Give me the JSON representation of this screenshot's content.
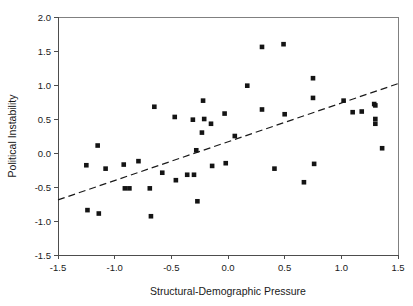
{
  "chart_data": {
    "type": "scatter",
    "title": "",
    "xlabel": "Structural-Demographic Pressure",
    "ylabel": "Political Instability",
    "xlim": [
      -1.5,
      1.5
    ],
    "ylim": [
      -1.5,
      2.0
    ],
    "xticks": [
      "-1.5",
      "-1.0",
      "-0.5",
      "0.0",
      "0.5",
      "1.0",
      "1.5"
    ],
    "xtick_values": [
      -1.5,
      -1.0,
      -0.5,
      0.0,
      0.5,
      1.0,
      1.5
    ],
    "yticks": [
      "-1.5",
      "-1.0",
      "-0.5",
      "0.0",
      "0.5",
      "1.0",
      "1.5",
      "2.0"
    ],
    "ytick_values": [
      -1.5,
      -1.0,
      -0.5,
      0.0,
      0.5,
      1.0,
      1.5,
      2.0
    ],
    "grid": false,
    "legend": false,
    "marker": "square",
    "marker_color": "#141414",
    "series": [
      {
        "name": "observations",
        "points": [
          [
            -1.25,
            -0.18
          ],
          [
            -1.24,
            -0.84
          ],
          [
            -1.15,
            0.11
          ],
          [
            -1.14,
            -0.89
          ],
          [
            -1.08,
            -0.23
          ],
          [
            -0.92,
            -0.17
          ],
          [
            -0.91,
            -0.52
          ],
          [
            -0.87,
            -0.52
          ],
          [
            -0.79,
            -0.12
          ],
          [
            -0.69,
            -0.52
          ],
          [
            -0.68,
            -0.93
          ],
          [
            -0.65,
            0.68
          ],
          [
            -0.58,
            -0.29
          ],
          [
            -0.47,
            0.53
          ],
          [
            -0.46,
            -0.4
          ],
          [
            -0.36,
            -0.32
          ],
          [
            -0.31,
            0.49
          ],
          [
            -0.3,
            -0.32
          ],
          [
            -0.28,
            0.04
          ],
          [
            -0.27,
            -0.71
          ],
          [
            -0.23,
            0.3
          ],
          [
            -0.22,
            0.77
          ],
          [
            -0.21,
            0.5
          ],
          [
            -0.15,
            0.43
          ],
          [
            -0.14,
            -0.19
          ],
          [
            -0.03,
            0.58
          ],
          [
            -0.02,
            -0.15
          ],
          [
            0.06,
            0.25
          ],
          [
            0.17,
            0.99
          ],
          [
            0.3,
            1.56
          ],
          [
            0.3,
            0.64
          ],
          [
            0.41,
            -0.23
          ],
          [
            0.49,
            1.6
          ],
          [
            0.5,
            0.57
          ],
          [
            0.67,
            -0.43
          ],
          [
            0.75,
            1.1
          ],
          [
            0.75,
            0.81
          ],
          [
            0.76,
            -0.16
          ],
          [
            1.02,
            0.77
          ],
          [
            1.1,
            0.6
          ],
          [
            1.18,
            0.61
          ],
          [
            1.29,
            0.72
          ],
          [
            1.3,
            0.7
          ],
          [
            1.3,
            0.5
          ],
          [
            1.3,
            0.43
          ],
          [
            1.36,
            0.07
          ]
        ]
      }
    ],
    "trendline": {
      "style": "dashed",
      "x_start": -1.5,
      "y_start": -0.69,
      "x_end": 1.5,
      "y_end": 1.02
    }
  }
}
